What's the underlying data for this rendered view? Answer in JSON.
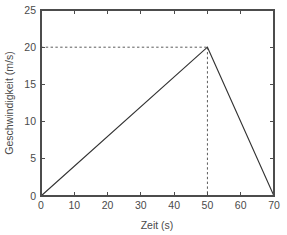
{
  "chart_data": {
    "type": "line",
    "title": "",
    "xlabel": "Zeit (s)",
    "ylabel": "Geschwindigkeit (m/s)",
    "xlim": [
      0,
      70
    ],
    "ylim": [
      0,
      25
    ],
    "xticks": [
      0,
      10,
      20,
      30,
      40,
      50,
      60,
      70
    ],
    "yticks": [
      0,
      5,
      10,
      15,
      20,
      25
    ],
    "xtick_labels": [
      "0",
      "10",
      "20",
      "30",
      "40",
      "50",
      "60",
      "70"
    ],
    "ytick_labels": [
      "0",
      "5",
      "10",
      "15",
      "20",
      "25"
    ],
    "grid": false,
    "legend": false,
    "box": true,
    "tick_direction": "in",
    "series": [
      {
        "name": "Geschwindigkeit",
        "x": [
          0,
          50,
          70
        ],
        "values": [
          0,
          20,
          0
        ],
        "color": "#333333",
        "style": "solid"
      }
    ],
    "annotations": [
      {
        "name": "peak-horizontal-guide",
        "type": "dashed-line",
        "from": [
          0,
          20
        ],
        "to": [
          50,
          20
        ]
      },
      {
        "name": "peak-vertical-guide",
        "type": "dashed-line",
        "from": [
          50,
          20
        ],
        "to": [
          50,
          0
        ]
      }
    ],
    "peak_point": {
      "x": 50,
      "y": 20,
      "label": ""
    }
  },
  "colors": {
    "background": "#ffffff",
    "axis": "#4c4c4c",
    "data_line": "#333333",
    "guide_line": "#4a4a4a",
    "text": "#4a4a4a"
  }
}
